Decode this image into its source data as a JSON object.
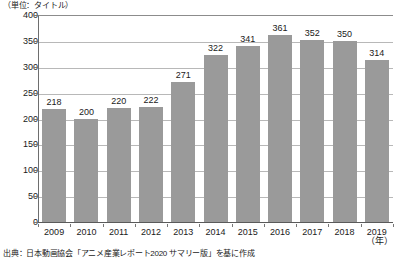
{
  "unit_caption": "（単位：タイトル）",
  "x_axis_unit": "（年）",
  "source_note": "出典：日本動画協会「アニメ産業レポート2020 サマリー版」を基に作成",
  "colors": {
    "bar": "#9a9a9a",
    "gridline": "#b8b8b8",
    "axis": "#5a5a5a",
    "text": "#1a1a1a",
    "background": "#ffffff"
  },
  "chart_data": {
    "type": "bar",
    "title": "",
    "subtitle": "",
    "xlabel": "（年）",
    "ylabel": "（単位：タイトル）",
    "categories": [
      "2009",
      "2010",
      "2011",
      "2012",
      "2013",
      "2014",
      "2015",
      "2016",
      "2017",
      "2018",
      "2019"
    ],
    "values": [
      218,
      200,
      220,
      222,
      271,
      322,
      341,
      361,
      352,
      350,
      314
    ],
    "value_labels": [
      "218",
      "200",
      "220",
      "222",
      "271",
      "322",
      "341",
      "361",
      "352",
      "350",
      "314"
    ],
    "ylim": [
      0,
      400
    ],
    "yticks": [
      0,
      50,
      100,
      150,
      200,
      250,
      300,
      350,
      400
    ],
    "ytick_labels": [
      "0",
      "50",
      "100",
      "150",
      "200",
      "250",
      "300",
      "350",
      "400"
    ],
    "grid": true,
    "legend": false,
    "legend_position": "none",
    "series": [
      {
        "name": "タイトル数",
        "values": [
          218,
          200,
          220,
          222,
          271,
          322,
          341,
          361,
          352,
          350,
          314
        ]
      }
    ]
  }
}
